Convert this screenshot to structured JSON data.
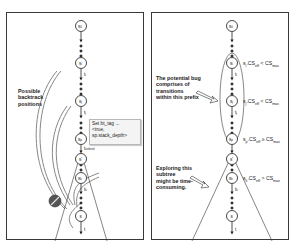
{
  "left_panel": {
    "nodes": [
      {
        "id": "s0",
        "label": "s0"
      },
      {
        "id": "si",
        "label": "si",
        "transition": "ti"
      },
      {
        "id": "sj",
        "label": "sj",
        "transition": "tj"
      },
      {
        "id": "sp",
        "label": "sp",
        "transition": "t_setbvnd"
      },
      {
        "id": "s_prime",
        "label": "s'"
      },
      {
        "id": "sk",
        "label": "sk",
        "transition": "tk"
      },
      {
        "id": "s",
        "label": "s",
        "transition": "t"
      }
    ],
    "backtrack_label": [
      "Possible",
      "backtrack",
      "positions"
    ],
    "tooltip": {
      "line1": "Set bt_tag ←",
      "line2": "<true,",
      "line3": "sp.stack_depth>"
    },
    "setbvnd_label": "t_setbvnd",
    "blocked_icon": "no-entry-icon"
  },
  "right_panel": {
    "nodes": [
      {
        "id": "s0",
        "label": "s0"
      },
      {
        "id": "si",
        "label": "si",
        "transition": "ti"
      },
      {
        "id": "sj",
        "label": "sj",
        "transition": "tj"
      },
      {
        "id": "sp",
        "label": "sp"
      },
      {
        "id": "s_prime",
        "label": "s'"
      },
      {
        "id": "sk",
        "label": "sk",
        "transition": "tk"
      },
      {
        "id": "s",
        "label": "s",
        "transition": "t"
      }
    ],
    "conditions": [
      {
        "node": "si",
        "text": "si.CSeff < CSmax"
      },
      {
        "node": "sj",
        "text": "sj.CSeff < CSmax"
      },
      {
        "node": "sp",
        "text": "sp.CSeff ≥ CSmax"
      },
      {
        "node": "sk",
        "text": "sk.CSeff > CSmax"
      }
    ],
    "prefix_note": [
      "The potential bug",
      "comprises of",
      "transitions",
      "within this prefix"
    ],
    "subtree_note": [
      "Exploring this",
      "subtree",
      "might be time-",
      "consuming."
    ]
  },
  "colors": {
    "border": "#3a3a3a",
    "node_stroke": "#333333",
    "arrow_fill": "#dcdcdc",
    "blocked_fill": "#555555",
    "tooltip_bg": "#f4f4f4"
  }
}
